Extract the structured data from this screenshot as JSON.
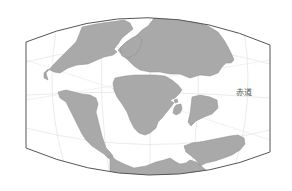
{
  "map": {
    "title": "",
    "projection": "pseudo-cylindrical",
    "colors": {
      "land": "#a9a9a9",
      "land_stroke": "#8e8e8e",
      "ocean": "#ffffff",
      "frame": "#555555",
      "graticule": "#e2e2e2"
    },
    "labels": {
      "equator": "赤道"
    }
  }
}
